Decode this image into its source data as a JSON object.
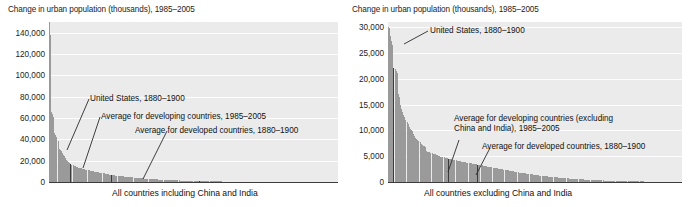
{
  "figure": {
    "panels": [
      {
        "id": "all-countries",
        "axis_title": "Change in urban population (thousands), 1985–2005",
        "xlabel": "All countries including China and India",
        "yticks": [
          "0",
          "20,000",
          "40,000",
          "60,000",
          "80,000",
          "100,000",
          "120,000",
          "140,000"
        ],
        "annotations": [
          {
            "id": "united-states",
            "text": "United States, 1880–1900"
          },
          {
            "id": "avg-developing",
            "text": "Average for developing countries, 1985–2005"
          },
          {
            "id": "avg-developed",
            "text": "Average for developed countries, 1880–1900"
          }
        ]
      },
      {
        "id": "excluding-china-india",
        "axis_title": "Change in urban population (thousands), 1985–2005",
        "xlabel": "All countries excluding China and India",
        "yticks": [
          "0",
          "5,000",
          "10,000",
          "15,000",
          "20,000",
          "25,000",
          "30,000"
        ],
        "annotations": [
          {
            "id": "united-states",
            "text": "United States, 1880–1900"
          },
          {
            "id": "avg-developing",
            "text": "Average for developing countries (excluding China and India), 1985–2005"
          },
          {
            "id": "avg-developed",
            "text": "Average for developed countries, 1880–1900"
          }
        ]
      }
    ]
  },
  "chart_data": [
    {
      "type": "bar",
      "id": "all-countries",
      "title": "Change in urban population (thousands), 1985–2005",
      "xlabel": "All countries including China and India",
      "ylabel": "Change in urban population (thousands), 1985–2005",
      "ylim": [
        0,
        150000
      ],
      "ytick_values": [
        0,
        20000,
        40000,
        60000,
        80000,
        100000,
        120000,
        140000
      ],
      "grid": "horizontal",
      "legend": "none",
      "sorted": "descending",
      "note": "Countries sorted descending by change in urban population; China and India are the two tallest bars.",
      "values": [
        150000,
        138000,
        66000,
        64000,
        61000,
        46000,
        44000,
        42000,
        38000,
        31000,
        30000,
        29000,
        27000,
        25500,
        24000,
        22500,
        21000,
        19500,
        18500,
        17500,
        16800,
        16000,
        15500,
        15000,
        14600,
        14200,
        13900,
        13600,
        13300,
        13000,
        12700,
        12400,
        12100,
        11800,
        11500,
        11200,
        11000,
        10800,
        10600,
        10400,
        10200,
        10000,
        9800,
        9600,
        9400,
        9200,
        9000,
        8800,
        8600,
        8400,
        8200,
        8000,
        7800,
        7600,
        7400,
        7200,
        7000,
        6850,
        6700,
        6550,
        6400,
        6250,
        6100,
        5950,
        5800,
        5650,
        5500,
        5400,
        5300,
        5200,
        5100,
        5000,
        4900,
        4800,
        4700,
        4600,
        4500,
        4400,
        4300,
        4200,
        4100,
        4000,
        3900,
        3800,
        3700,
        3600,
        3500,
        3420,
        3340,
        3260,
        3180,
        3100,
        3020,
        2940,
        2860,
        2780,
        2700,
        2640,
        2580,
        2520,
        2460,
        2400,
        2340,
        2280,
        2220,
        2160,
        2100,
        2050,
        2000,
        1950,
        1900,
        1850,
        1800,
        1760,
        1720,
        1680,
        1640,
        1600,
        1560,
        1520,
        1480,
        1440,
        1400,
        1365,
        1330,
        1295,
        1260,
        1230,
        1200,
        1170,
        1140,
        1110,
        1080,
        1050,
        1020,
        995,
        970,
        945,
        920,
        895,
        870,
        848,
        826,
        804,
        782,
        760,
        740,
        720,
        700,
        682,
        664,
        646,
        628,
        610,
        594,
        578,
        562,
        546,
        530,
        516,
        502,
        488,
        474,
        460,
        448,
        436,
        424,
        412,
        400,
        390,
        380,
        370,
        360,
        350,
        341,
        332,
        323,
        314,
        305,
        297,
        289,
        281,
        273,
        265,
        258,
        251,
        244,
        237,
        230,
        224,
        218,
        212,
        206,
        200,
        195,
        190,
        185,
        180,
        175,
        170,
        165,
        160,
        156,
        152,
        148,
        144,
        140,
        136,
        132,
        128,
        124,
        120,
        117,
        114,
        111,
        108,
        105,
        102,
        99,
        96,
        93,
        90,
        88,
        86,
        84,
        82,
        80,
        78,
        76,
        74,
        72,
        70,
        68,
        66,
        64,
        62,
        60,
        58,
        56,
        54,
        52,
        50,
        48,
        46,
        44,
        42,
        40,
        38,
        36,
        34,
        32,
        30,
        28,
        26,
        24,
        22,
        20,
        18,
        16,
        14,
        12,
        10,
        8,
        6,
        5,
        4,
        3,
        2,
        1,
        0
      ],
      "markers": [
        {
          "label": "United States, 1880–1900",
          "index": 20,
          "value": 15000
        },
        {
          "label": "Average for developing countries, 1985–2005",
          "index": 58,
          "value": 6700
        },
        {
          "label": "Average for developed countries, 1880–1900",
          "index": 140,
          "value": 1000
        }
      ]
    },
    {
      "type": "bar",
      "id": "excluding-china-india",
      "title": "Change in urban population (thousands), 1985–2005",
      "xlabel": "All countries excluding China and India",
      "ylabel": "Change in urban population (thousands), 1985–2005",
      "ylim": [
        0,
        31000
      ],
      "ytick_values": [
        0,
        5000,
        10000,
        15000,
        20000,
        25000,
        30000
      ],
      "grid": "horizontal",
      "legend": "none",
      "sorted": "descending",
      "note": "Same series as left panel with China and India removed; vertical scale rescaled to 30,000.",
      "values": [
        30000,
        29800,
        28200,
        27300,
        26600,
        22000,
        21800,
        21500,
        21200,
        17000,
        16500,
        15000,
        14200,
        13600,
        13000,
        12600,
        12100,
        11700,
        11200,
        10600,
        10200,
        10000,
        9900,
        9300,
        8900,
        8600,
        8300,
        8100,
        7900,
        7700,
        7400,
        7200,
        7000,
        6900,
        6800,
        6000,
        5900,
        5850,
        5800,
        5700,
        5600,
        5500,
        5400,
        5350,
        5300,
        5200,
        5100,
        5000,
        4900,
        4850,
        4800,
        4750,
        4700,
        4650,
        4600,
        4550,
        4500,
        4450,
        4400,
        4350,
        4300,
        4250,
        4200,
        4150,
        4100,
        4050,
        4000,
        3960,
        3920,
        3880,
        3840,
        3800,
        3760,
        3720,
        3680,
        3640,
        3600,
        3560,
        3520,
        3480,
        3440,
        3400,
        3360,
        3320,
        3280,
        3240,
        3200,
        3160,
        3120,
        3080,
        3040,
        3000,
        2960,
        2920,
        2880,
        2840,
        2800,
        2760,
        2720,
        2680,
        2640,
        2600,
        2560,
        2520,
        2480,
        2440,
        2400,
        2360,
        2320,
        2280,
        2240,
        2200,
        2160,
        2120,
        2080,
        2040,
        2000,
        1960,
        1920,
        1880,
        1840,
        1800,
        1770,
        1740,
        1710,
        1680,
        1650,
        1620,
        1590,
        1560,
        1530,
        1500,
        1470,
        1440,
        1410,
        1380,
        1350,
        1320,
        1290,
        1260,
        1230,
        1200,
        1175,
        1150,
        1125,
        1100,
        1075,
        1050,
        1025,
        1000,
        980,
        960,
        940,
        920,
        900,
        880,
        860,
        840,
        820,
        800,
        782,
        764,
        746,
        728,
        710,
        694,
        678,
        662,
        646,
        630,
        615,
        600,
        585,
        570,
        556,
        542,
        528,
        514,
        500,
        488,
        476,
        464,
        452,
        440,
        429,
        418,
        407,
        396,
        385,
        375,
        365,
        355,
        345,
        336,
        327,
        318,
        309,
        300,
        292,
        284,
        276,
        268,
        260,
        253,
        246,
        239,
        232,
        225,
        219,
        213,
        207,
        201,
        195,
        190,
        185,
        180,
        175,
        170,
        165,
        160,
        155,
        150,
        146,
        142,
        138,
        134,
        130,
        126,
        122,
        118,
        114,
        110,
        107,
        104,
        101,
        98,
        95,
        92,
        89,
        86,
        83,
        80,
        77,
        74,
        71,
        68,
        65,
        62,
        59,
        56,
        53,
        50,
        47,
        44,
        41,
        38,
        35,
        32,
        29,
        26,
        23,
        20,
        17,
        14,
        11,
        9,
        7,
        5,
        3,
        1
      ],
      "markers": [
        {
          "label": "United States, 1880–1900",
          "index": 5,
          "value": 26000
        },
        {
          "label": "Average for developing countries (excluding China and India), 1985–2005",
          "index": 55,
          "value": 4600
        },
        {
          "label": "Average for developed countries, 1880–1900",
          "index": 82,
          "value": 3400
        }
      ]
    }
  ]
}
